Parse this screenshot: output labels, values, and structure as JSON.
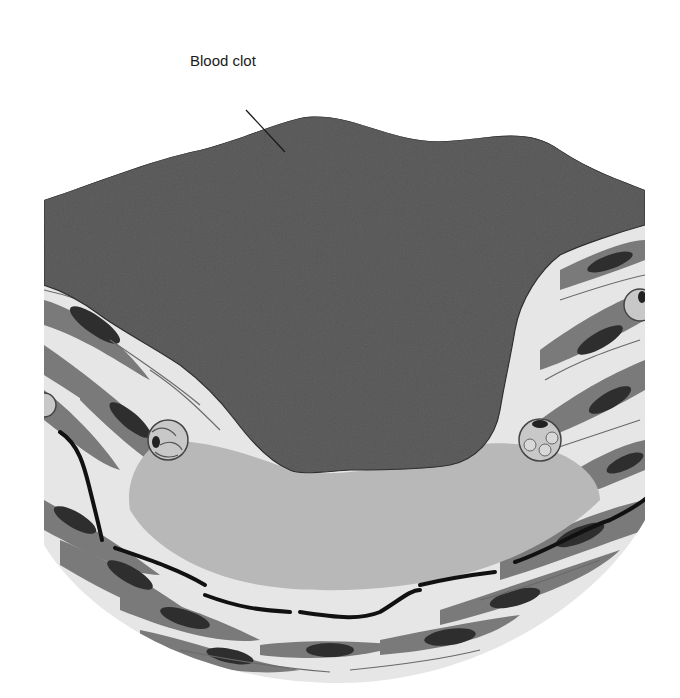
{
  "figure": {
    "labels": [
      {
        "id": "blood-clot",
        "text": "Blood clot"
      }
    ],
    "colors": {
      "background": "#ffffff",
      "clot": "#555555",
      "plaque": "#b8b8b8",
      "tissue_light": "#e6e6e6",
      "cell_body": "#7a7a7a",
      "nucleus": "#2e2e2e",
      "elastic_fiber": "#111111",
      "foam_cell": "#c8c8c8"
    }
  }
}
